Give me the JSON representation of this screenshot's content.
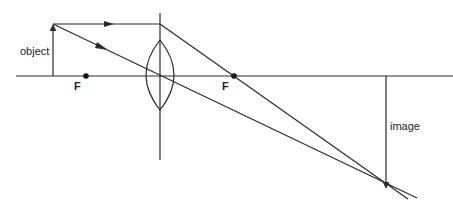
{
  "diagram": {
    "type": "converging-lens-ray-diagram",
    "labels": {
      "object": "object",
      "image": "image",
      "focal_left": "F",
      "focal_right": "F"
    },
    "colors": {
      "line": "#2a2a2a",
      "background": "#ffffff"
    }
  }
}
